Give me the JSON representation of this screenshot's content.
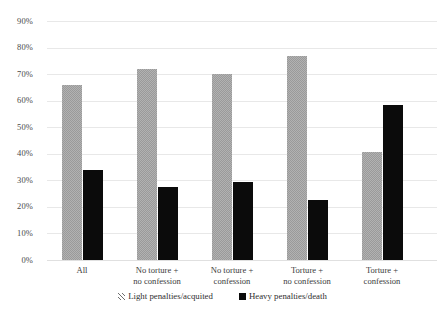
{
  "chart_data": {
    "type": "bar",
    "title": "",
    "xlabel": "",
    "ylabel": "",
    "ylim": [
      0,
      90
    ],
    "y_tick_labels": [
      "90%",
      "80%",
      "70%",
      "60%",
      "50%",
      "40%",
      "30%",
      "20%",
      "10%",
      "0%"
    ],
    "y_tick_values": [
      90,
      80,
      70,
      60,
      50,
      40,
      30,
      20,
      10,
      0
    ],
    "grid": true,
    "legend_position": "bottom",
    "categories": [
      "All",
      "No torture +\nno confession",
      "No torture +\nconfession",
      "Torture +\nno confession",
      "Torture +\nconfession"
    ],
    "category_lines": [
      [
        "All"
      ],
      [
        "No torture +",
        "no confession"
      ],
      [
        "No torture +",
        "confession"
      ],
      [
        "Torture +",
        "no confession"
      ],
      [
        "Torture +",
        "confession"
      ]
    ],
    "series": [
      {
        "name": "Light penalties/acquited",
        "color": "#b2b2b2",
        "pattern": "checker",
        "values": [
          66,
          72,
          70,
          77,
          40.5
        ]
      },
      {
        "name": "Heavy penalties/death",
        "color": "#0b0b0b",
        "pattern": "solid",
        "values": [
          34,
          27.5,
          29.5,
          22.5,
          58.5
        ]
      }
    ]
  },
  "legend": {
    "items": [
      {
        "label": "Light penalties/acquited",
        "marker": "hatched-square-icon"
      },
      {
        "label": "Heavy penalties/death",
        "marker": "filled-square-icon"
      }
    ]
  }
}
